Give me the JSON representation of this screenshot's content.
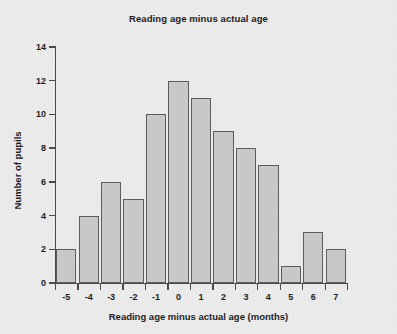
{
  "chart_data": {
    "type": "bar",
    "title": "Reading age minus actual age",
    "xlabel": "Reading age minus actual age (months)",
    "ylabel": "Number of pupils",
    "categories": [
      "-5",
      "-4",
      "-3",
      "-2",
      "-1",
      "0",
      "1",
      "2",
      "3",
      "4",
      "5",
      "6",
      "7"
    ],
    "values": [
      2,
      4,
      6,
      5,
      10,
      12,
      11,
      9,
      8,
      7,
      1,
      3,
      2
    ],
    "ylim": [
      0,
      14
    ],
    "ytick_labels": [
      "0",
      "2",
      "4",
      "6",
      "8",
      "10",
      "12",
      "14"
    ],
    "ytick_values": [
      0,
      2,
      4,
      6,
      8,
      10,
      12,
      14
    ],
    "grid": false,
    "legend": false,
    "legend_position": "none",
    "bar_fill_color": "#c9c9c9",
    "bar_edge_color": "#5d5d5d",
    "axis_color": "#4a4a4a",
    "text_color": "#1d1d1d",
    "background_color": "#ebebeb"
  }
}
